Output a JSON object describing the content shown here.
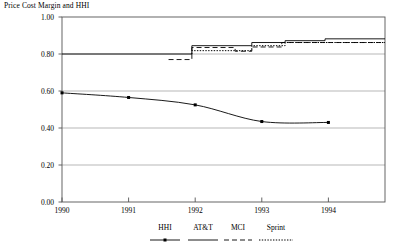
{
  "chart_data": {
    "type": "line",
    "title": "Price Cost Margin and HHI",
    "xlabel": "",
    "ylabel": "",
    "xlim": [
      1990,
      1994.85
    ],
    "ylim": [
      0.0,
      1.0
    ],
    "grid": true,
    "legend_position": "bottom",
    "x_ticks": [
      "1990",
      "1991",
      "1992",
      "1993",
      "1994"
    ],
    "x_tick_values": [
      1990,
      1991,
      1992,
      1993,
      1994
    ],
    "y_ticks": [
      "0.00",
      "0.20",
      "0.40",
      "0.60",
      "0.80",
      "1.00"
    ],
    "y_tick_values": [
      0.0,
      0.2,
      0.4,
      0.6,
      0.8,
      1.0
    ],
    "series": [
      {
        "name": "HHI",
        "style": "solid-marker",
        "x": [
          1990.0,
          1991.0,
          1992.0,
          1993.0,
          1994.0
        ],
        "values": [
          0.59,
          0.565,
          0.525,
          0.435,
          0.43
        ]
      },
      {
        "name": "AT&T",
        "style": "solid",
        "x": [
          1990.0,
          1991.95,
          1991.95,
          1992.85,
          1992.85,
          1993.35,
          1993.35,
          1993.95,
          1993.95,
          1994.85
        ],
        "values": [
          0.8,
          0.8,
          0.845,
          0.845,
          0.862,
          0.862,
          0.872,
          0.872,
          0.882,
          0.882
        ]
      },
      {
        "name": "MCI",
        "style": "dashed",
        "x": [
          1991.6,
          1991.6,
          1991.95,
          1991.95,
          1992.6,
          1992.6,
          1992.85,
          1992.85,
          1993.3,
          1993.3,
          1994.85
        ],
        "values": [
          0.77,
          0.77,
          0.77,
          0.835,
          0.835,
          0.815,
          0.815,
          0.838,
          0.838,
          0.862,
          0.862
        ]
      },
      {
        "name": "Sprint",
        "style": "dotted",
        "x": [
          1991.95,
          1991.95,
          1992.85,
          1992.85,
          1993.35,
          1993.35,
          1994.85
        ],
        "values": [
          0.8,
          0.818,
          0.818,
          0.845,
          0.845,
          0.862,
          0.862
        ]
      }
    ],
    "legend": [
      {
        "label": "HHI",
        "style": "solid-marker"
      },
      {
        "label": "AT&T",
        "style": "solid"
      },
      {
        "label": "MCI",
        "style": "dashed"
      },
      {
        "label": "Sprint",
        "style": "dotted"
      }
    ],
    "colors": {
      "line": "#000000",
      "grid": "#9a9a9a",
      "axis": "#555555",
      "background": "#ffffff"
    }
  }
}
